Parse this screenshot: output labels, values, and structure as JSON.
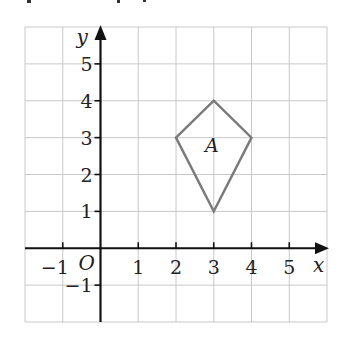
{
  "chart_data": {
    "type": "diagram",
    "title": "",
    "xlabel": "x",
    "ylabel": "y",
    "origin_label": "O",
    "xlim": [
      -2,
      6
    ],
    "ylim": [
      -2,
      6
    ],
    "grid": true,
    "x_ticks": [
      -1,
      1,
      2,
      3,
      4,
      5
    ],
    "x_tick_labels": [
      "−1",
      "1",
      "2",
      "3",
      "4",
      "5"
    ],
    "y_ticks": [
      -1,
      1,
      2,
      3,
      4,
      5
    ],
    "y_tick_labels": [
      "−1",
      "1",
      "2",
      "3",
      "4",
      "5"
    ],
    "shapes": [
      {
        "name": "A",
        "kind": "kite",
        "vertices": [
          [
            2,
            3
          ],
          [
            3,
            4
          ],
          [
            4,
            3
          ],
          [
            3,
            1
          ]
        ],
        "label_position": [
          2.95,
          2.6
        ],
        "stroke_color": "#7a7a7a"
      }
    ]
  }
}
